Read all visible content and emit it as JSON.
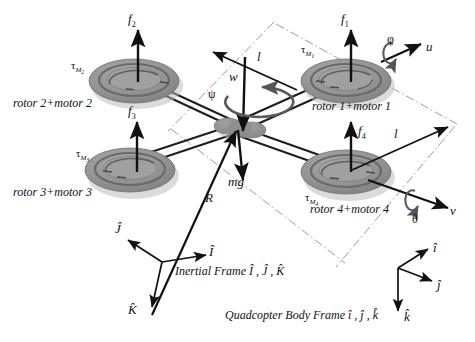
{
  "figure": {
    "type": "schematic-diagram"
  },
  "colors": {
    "background": "#ffffff",
    "ink": "#111111",
    "rotor_outer": "#9a9a9a",
    "rotor_mid": "#8c8c8c",
    "rotor_inner": "#a6a6a6",
    "rotor_shadow": "#b9b9b9",
    "rotor_rim_dark": "#6e6e6e",
    "hub": "#8f8f8f",
    "arm": "#2a2a2a",
    "dashdot": "#9b9b9b",
    "arrow": "#111111",
    "spin_arrow": "#555555"
  },
  "rotors": [
    {
      "id": "rotor-1",
      "name_label": "rotor 1+motor 1",
      "force_label": "f",
      "force_sub": "1",
      "torque_label": "τ",
      "torque_sub": "M",
      "torque_sub_sub": "1"
    },
    {
      "id": "rotor-2",
      "name_label": "rotor 2+motor 2",
      "force_label": "f",
      "force_sub": "2",
      "torque_label": "τ",
      "torque_sub": "M",
      "torque_sub_sub": "2"
    },
    {
      "id": "rotor-3",
      "name_label": "rotor 3+motor 3",
      "force_label": "f",
      "force_sub": "3",
      "torque_label": "τ",
      "torque_sub": "M",
      "torque_sub_sub": "3"
    },
    {
      "id": "rotor-4",
      "name_label": "rotor 4+motor 4",
      "force_label": "f",
      "force_sub": "4",
      "torque_label": "τ",
      "torque_sub": "M",
      "torque_sub_sub": "4"
    }
  ],
  "center": {
    "weight_label": "mg",
    "angular_rate_label": "w",
    "yaw_label": "ψ",
    "position_vector_label": "R"
  },
  "arm_lengths": {
    "label_top": "l",
    "label_right": "l"
  },
  "body_axes_annotations": {
    "roll_label": "φ",
    "roll_velocity_label": "u",
    "pitch_label": "θ",
    "pitch_velocity_label": "v"
  },
  "inertial_frame": {
    "caption": "Inertial Frame Î , Ĵ , K̂",
    "axis_x": "Î",
    "axis_y": "Ĵ",
    "axis_z": "K̂"
  },
  "body_frame": {
    "caption": "Quadcopter Body Frame î , ĵ , k̂",
    "axis_x": "î",
    "axis_y": "ĵ",
    "axis_z": "k̂"
  }
}
